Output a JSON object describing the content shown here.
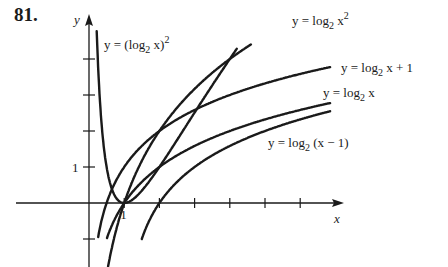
{
  "problem_number": "81.",
  "chart_data": {
    "type": "line",
    "title": "",
    "xlabel": "x",
    "ylabel": "y",
    "xlim": [
      0,
      7
    ],
    "ylim": [
      -1.8,
      5.2
    ],
    "grid": false,
    "x_ticks": [
      1,
      2,
      3,
      4,
      5,
      6
    ],
    "x_tick_labels": {
      "1": "1"
    },
    "y_ticks": [
      -1,
      1,
      2,
      3,
      4
    ],
    "y_tick_labels": {
      "1": "1"
    },
    "series": [
      {
        "name": "y = (log2 x)^2",
        "fn": "sqlog",
        "label_parts": [
          "y = (log",
          "2",
          " x)",
          "2"
        ]
      },
      {
        "name": "y = log2 x^2",
        "fn": "log2x2",
        "label_parts": [
          "y = log",
          "2",
          " x",
          "2"
        ]
      },
      {
        "name": "y = log2 x + 1",
        "fn": "log2xp1",
        "label_parts": [
          "y = log",
          "2",
          " x + 1"
        ]
      },
      {
        "name": "y = log2 x",
        "fn": "log2x",
        "label_parts": [
          "y = log",
          "2",
          " x"
        ]
      },
      {
        "name": "y = log2 (x - 1)",
        "fn": "log2xm1",
        "label_parts": [
          "y = log",
          "2",
          " (x − 1)"
        ]
      }
    ],
    "annotations": [
      "y = (log2 x)^2",
      "y = log2 x^2",
      "y = log2 x + 1",
      "y = log2 x",
      "y = log2 (x - 1)"
    ]
  },
  "colors": {
    "ink": "#1a1a1a",
    "background": "#ffffff"
  }
}
